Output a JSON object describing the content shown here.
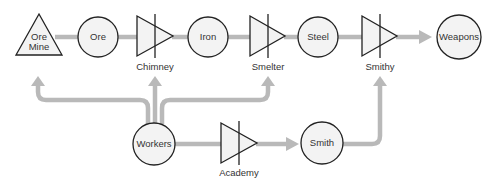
{
  "diagram": {
    "colors": {
      "flow": "#b9b9b9",
      "node_fill": "#f3f3f3",
      "node_stroke": "#222222",
      "text": "#333333"
    },
    "sources": [
      {
        "id": "ore_mine",
        "shape": "triangle",
        "label_line1": "Ore",
        "label_line2": "Mine"
      }
    ],
    "resources": [
      {
        "id": "ore",
        "label": "Ore"
      },
      {
        "id": "iron",
        "label": "Iron"
      },
      {
        "id": "steel",
        "label": "Steel"
      },
      {
        "id": "weapons",
        "label": "Weapons"
      },
      {
        "id": "workers",
        "label": "Workers"
      },
      {
        "id": "smith",
        "label": "Smith"
      }
    ],
    "converters": [
      {
        "id": "chimney",
        "label": "Chimney"
      },
      {
        "id": "smelter",
        "label": "Smelter"
      },
      {
        "id": "smithy",
        "label": "Smithy"
      },
      {
        "id": "academy",
        "label": "Academy"
      }
    ],
    "connections": [
      [
        "Ore Mine",
        "Ore"
      ],
      [
        "Ore",
        "Chimney"
      ],
      [
        "Chimney",
        "Iron"
      ],
      [
        "Iron",
        "Smelter"
      ],
      [
        "Smelter",
        "Steel"
      ],
      [
        "Steel",
        "Smithy"
      ],
      [
        "Smithy",
        "Weapons"
      ],
      [
        "Workers",
        "Ore Mine"
      ],
      [
        "Workers",
        "Chimney"
      ],
      [
        "Workers",
        "Smelter"
      ],
      [
        "Workers",
        "Academy"
      ],
      [
        "Academy",
        "Smith"
      ],
      [
        "Smith",
        "Smithy"
      ]
    ]
  }
}
